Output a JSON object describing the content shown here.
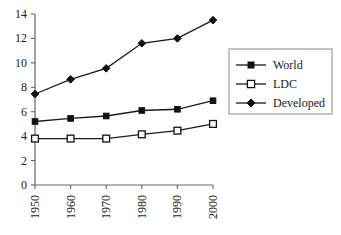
{
  "chart_data": {
    "type": "line",
    "title": "",
    "subtitle": "",
    "xlabel": "",
    "ylabel": "",
    "categories": [
      "1950",
      "1960",
      "1970",
      "1980",
      "1990",
      "2000"
    ],
    "x": [
      1950,
      1960,
      1970,
      1980,
      1990,
      2000
    ],
    "series": [
      {
        "name": "World",
        "marker": "filled-square",
        "color": "#000000",
        "values": [
          5.2,
          5.45,
          5.65,
          6.1,
          6.2,
          6.9
        ]
      },
      {
        "name": "LDC",
        "marker": "open-square",
        "color": "#000000",
        "values": [
          3.8,
          3.8,
          3.8,
          4.15,
          4.45,
          5.0
        ]
      },
      {
        "name": "Developed",
        "marker": "filled-diamond",
        "color": "#000000",
        "values": [
          7.45,
          8.65,
          9.55,
          11.6,
          12.0,
          13.5
        ]
      }
    ],
    "ylim": [
      0,
      14
    ],
    "yticks": [
      0,
      2,
      4,
      6,
      8,
      10,
      12,
      14
    ],
    "ytick_labels": [
      "0",
      "2",
      "4",
      "6",
      "8",
      "10",
      "12",
      "14"
    ],
    "xtick_labels": [
      "1950",
      "1960",
      "1970",
      "1980",
      "1990",
      "2000"
    ],
    "xtick_rotation": -90,
    "grid": false,
    "legend_position": "right",
    "legend_border_color": "#808080",
    "axis_color": "#555555",
    "line_color": "#1a1a1a",
    "background": "#ffffff"
  },
  "legend": {
    "entries": [
      {
        "label": "World"
      },
      {
        "label": "LDC"
      },
      {
        "label": "Developed"
      }
    ]
  },
  "axes": {
    "y_tick_0": "0",
    "y_tick_1": "2",
    "y_tick_2": "4",
    "y_tick_3": "6",
    "y_tick_4": "8",
    "y_tick_5": "10",
    "y_tick_6": "12",
    "y_tick_7": "14",
    "x_tick_0": "1950",
    "x_tick_1": "1960",
    "x_tick_2": "1970",
    "x_tick_3": "1980",
    "x_tick_4": "1990",
    "x_tick_5": "2000"
  }
}
